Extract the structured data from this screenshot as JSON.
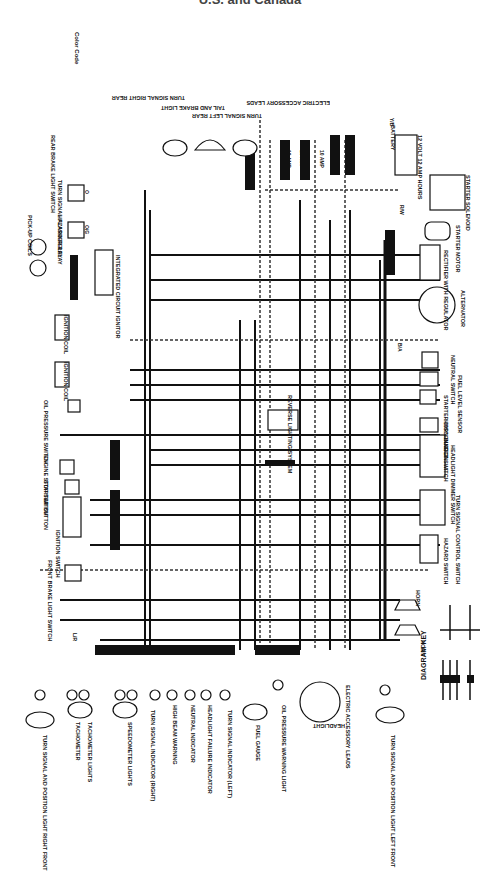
{
  "title": "U.S. and Canada",
  "color_code": {
    "heading": "Color Code",
    "entries": [
      {
        "code": "B",
        "name": "Black"
      },
      {
        "code": "L",
        "name": "Blue"
      },
      {
        "code": "Br",
        "name": "Brown"
      },
      {
        "code": "Ch",
        "name": "Chocolate"
      },
      {
        "code": "G",
        "name": "Green"
      },
      {
        "code": "Gy",
        "name": "Gray"
      },
      {
        "code": "LB",
        "name": "Light Blue"
      },
      {
        "code": "LG",
        "name": "Light Green"
      },
      {
        "code": "O",
        "name": "Orange"
      },
      {
        "code": "P",
        "name": "Pink"
      },
      {
        "code": "R",
        "name": "Red"
      },
      {
        "code": "W",
        "name": "White"
      },
      {
        "code": "Y",
        "name": "Yellow"
      },
      {
        "code": "B/W",
        "name": "Black/White"
      },
      {
        "code": "B/R",
        "name": "Black/Red"
      },
      {
        "code": "B/Y",
        "name": "Black/Yellow"
      },
      {
        "code": "G/W",
        "name": "Green/White"
      },
      {
        "code": "L/W",
        "name": "Blue/White"
      },
      {
        "code": "R/W",
        "name": "Red/White"
      },
      {
        "code": "W/R",
        "name": "White/Red"
      },
      {
        "code": "Y/W",
        "name": "Yellow/White"
      },
      {
        "code": "O/G",
        "name": "Orange/Green"
      }
    ]
  },
  "components": {
    "rear_brake_light_switch": "REAR BRAKE LIGHT SWITCH",
    "turn_signal_flasher_relay": "TURN SIGNAL FLASHER RELAY",
    "hazard_relay": "HAZARD RELAY",
    "pickup_coils": "PICK-UP COILS",
    "integrated_circuit_ignitor": "INTEGRATED CIRCUIT IGNITOR",
    "ignition_coil_1": "IGNITION COIL",
    "ignition_coil_2": "IGNITION COIL",
    "spark_plug": "SPARK PLUG",
    "oil_pressure_switch": "OIL PRESSURE SWITCH",
    "engine_stop_switch": "ENGINE STOP SWITCH",
    "starter_button": "STARTER BUTTON",
    "ignition_switch": "IGNITION SWITCH",
    "front_brake_light_switch": "FRONT BRAKE LIGHT SWITCH",
    "turn_signal_right_rear": "TURN SIGNAL RIGHT REAR",
    "tail_brake_light": "TAIL AND BRAKE LIGHT",
    "turn_signal_left_rear": "TURN SIGNAL LEFT REAR",
    "electric_accessory_leads_rear": "ELECTRIC ACCESSORY LEADS",
    "battery": "BATTERY",
    "battery_spec": "12 VOLT 12 AMP HOURS",
    "starter_solenoid": "STARTER SOLENOID",
    "starter_motor": "STARTER MOTOR",
    "rectifier": "RECTIFIER WITH REGULATOR",
    "alternator": "ALTERNATOR",
    "neutral_switch": "NEUTRAL SWITCH",
    "fuel_level_sensor": "FUEL LEVEL SENSOR",
    "starter_disconnect_switch": "STARTER DISCONNECT SWITCH",
    "horn_button": "HORN BUTTON",
    "headlight_dimmer_switch": "HEADLIGHT DIMMER SWITCH",
    "turn_signal_control_switch": "TURN SIGNAL CONTROL SWITCH",
    "hazard_switch": "HAZARD SWITCH",
    "horn_1": "HORN",
    "horn_2": "HORN",
    "reverse_lighting_system": "REVERSE LIGHTING SYSTEM",
    "turn_signal_right_front": "TURN SIGNAL AND POSITION LIGHT RIGHT FRONT",
    "tachometer": "TACHOMETER",
    "tachometer_lights": "TACHOMETER LIGHTS",
    "speedometer_lights": "SPEEDOMETER LIGHTS",
    "turn_signal_indicator_right": "TURN SIGNAL INDICATOR (RIGHT)",
    "high_beam_warning": "HIGH BEAM WARNING",
    "neutral_indicator": "NEUTRAL INDICATOR",
    "headlight_failure_indicator": "HEADLIGHT FAILURE INDICATOR",
    "turn_signal_indicator_left": "TURN SIGNAL INDICATOR (LEFT)",
    "fuel_gauge": "FUEL GAUGE",
    "oil_pressure_warning_light": "OIL PRESSURE WARNING LIGHT",
    "headlight": "HEADLIGHT",
    "electric_accessory_leads_front": "ELECTRIC ACCESSORY LEADS",
    "turn_signal_left_front": "TURN SIGNAL AND POSITION LIGHT LEFT FRONT"
  },
  "fuses": [
    "10 AMP",
    "10 AMP",
    "10 AMP",
    "10 AMP",
    "10 AMP",
    "30 AMP"
  ],
  "wire_labels": [
    "Y/B",
    "R/W",
    "B",
    "Y/B",
    "B/Y",
    "R/W",
    "G/O",
    "O",
    "O/G",
    "B/L",
    "W/B",
    "L/R",
    "B/A",
    "L/W",
    "B/W",
    "Y/W",
    "R/B",
    "G/B",
    "W/G",
    "L/G",
    "B/R",
    "Br/W"
  ],
  "diagram_key": {
    "heading": "DIAGRAM KEY",
    "items": [
      "CONNECTION",
      "NO CONNECTION",
      "GROUND",
      "FRAME GROUND",
      "CONNECTOR",
      "SINGLE CONNECTOR"
    ]
  }
}
